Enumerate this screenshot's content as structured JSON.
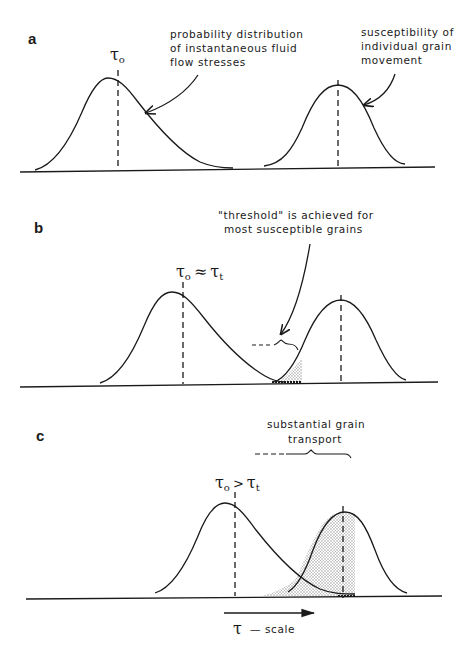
{
  "figure": {
    "colors": {
      "ink": "#1a1a1a",
      "shade": "#b8b8b8",
      "background": "#ffffff"
    },
    "panels": [
      {
        "id": "a",
        "label": "a",
        "tau_label": "τ",
        "tau_sub": "o",
        "annotations": [
          {
            "lines": [
              "probability  distribution",
              "of instantaneous  fluid",
              "flow  stresses"
            ]
          },
          {
            "lines": [
              "susceptibility of",
              "individual  grain",
              "movement"
            ]
          }
        ]
      },
      {
        "id": "b",
        "label": "b",
        "tau_label": "τ",
        "tau_sub": "o",
        "tau_relation": "≈",
        "tau_label2": "τ",
        "tau_sub2": "t",
        "annotations": [
          {
            "lines": [
              "\"threshold\"  is  achieved  for",
              "most  susceptible  grains"
            ]
          }
        ]
      },
      {
        "id": "c",
        "label": "c",
        "tau_label": "τ",
        "tau_sub": "o",
        "tau_relation": ">",
        "tau_label2": "τ",
        "tau_sub2": "t",
        "annotations": [
          {
            "lines": [
              "substantial  grain",
              "transport"
            ]
          }
        ]
      }
    ],
    "axis": {
      "arrow_label_symbol": "τ",
      "arrow_label_text": "—  scale"
    }
  }
}
